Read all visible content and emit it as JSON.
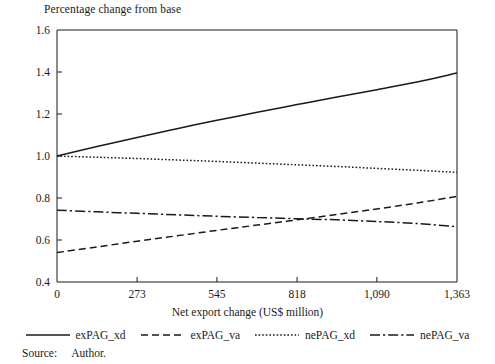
{
  "figure": {
    "title": "Percentage change from base",
    "source_label": "Source:",
    "source_value": "Author."
  },
  "chart_data": {
    "type": "line",
    "title": "Percentage change from base",
    "xlabel": "Net export change (US$ million)",
    "ylabel": "",
    "xlim": [
      0,
      1363
    ],
    "ylim": [
      0.4,
      1.6
    ],
    "grid": false,
    "legend_position": "bottom",
    "xticks": [
      0,
      273,
      545,
      818,
      1090,
      1363
    ],
    "xtick_labels": [
      "0",
      "273",
      "545",
      "818",
      "1,090",
      "1,363"
    ],
    "yticks": [
      0.4,
      0.6,
      0.8,
      1.0,
      1.2,
      1.4,
      1.6
    ],
    "ytick_labels": [
      "0.4",
      "0.6",
      "0.8",
      "1.0",
      "1.2",
      "1.4",
      "1.6"
    ],
    "x": [
      0,
      136,
      273,
      409,
      545,
      682,
      818,
      954,
      1090,
      1227,
      1363
    ],
    "series": [
      {
        "name": "exPAG_xd",
        "style": "solid",
        "color": "#1a1a1a",
        "values": [
          1.0,
          1.045,
          1.088,
          1.13,
          1.17,
          1.208,
          1.245,
          1.281,
          1.316,
          1.352,
          1.395
        ]
      },
      {
        "name": "exPAG_va",
        "style": "dashed",
        "color": "#1a1a1a",
        "values": [
          0.54,
          0.567,
          0.594,
          0.62,
          0.646,
          0.671,
          0.696,
          0.722,
          0.748,
          0.776,
          0.808
        ]
      },
      {
        "name": "nePAG_xd",
        "style": "dotted",
        "color": "#1a1a1a",
        "values": [
          1.0,
          0.994,
          0.988,
          0.981,
          0.974,
          0.966,
          0.958,
          0.95,
          0.941,
          0.932,
          0.922
        ]
      },
      {
        "name": "nePAG_va",
        "style": "dashdot",
        "color": "#1a1a1a",
        "values": [
          0.742,
          0.734,
          0.727,
          0.72,
          0.713,
          0.707,
          0.701,
          0.696,
          0.688,
          0.678,
          0.663
        ]
      }
    ]
  }
}
